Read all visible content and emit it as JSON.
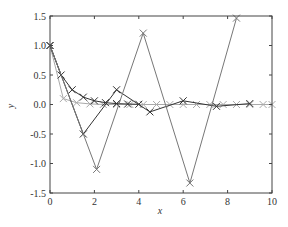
{
  "chart_data": {
    "type": "line",
    "title": "",
    "xlabel": "x",
    "ylabel": "y",
    "xlim": [
      0,
      10
    ],
    "ylim": [
      -1.5,
      1.5
    ],
    "xticks": [
      0,
      2,
      4,
      6,
      8,
      10
    ],
    "xtick_labels": [
      "0",
      "2",
      "4",
      "6",
      "8",
      "10"
    ],
    "yticks": [
      -1.5,
      -1.0,
      -0.5,
      0.0,
      0.5,
      1.0,
      1.5
    ],
    "ytick_labels": [
      "-1.5",
      "-1.0",
      "-0.5",
      "0.0",
      "0.5",
      "1.0",
      "1.5"
    ],
    "grid": false,
    "legend": null,
    "marker": "x",
    "series": [
      {
        "name": "light-decay",
        "color": "#aaaaaa",
        "x": [
          0,
          0.6,
          1.2,
          1.8,
          2.4,
          3.0,
          3.6,
          4.2,
          4.8,
          5.4,
          6.0,
          6.6,
          7.2,
          7.8,
          8.4,
          9.0,
          9.6,
          10.0
        ],
        "y": [
          1.0,
          0.1,
          0.03,
          0.01,
          0.0,
          0.0,
          0.0,
          0.0,
          0.0,
          0.0,
          0.0,
          0.0,
          0.0,
          0.0,
          0.0,
          0.0,
          0.0,
          0.0
        ]
      },
      {
        "name": "dark-decay",
        "color": "#333333",
        "x": [
          0,
          0.5,
          1.0,
          1.5,
          2.0,
          2.5,
          3.0,
          3.5,
          4.0
        ],
        "y": [
          1.0,
          0.5,
          0.25,
          0.125,
          0.0625,
          0.031,
          0.016,
          0.008,
          0.004
        ]
      },
      {
        "name": "dark-alternating",
        "color": "#333333",
        "x": [
          0,
          1.5,
          3.0,
          4.5,
          6.0,
          7.5,
          9.0
        ],
        "y": [
          1.0,
          -0.5,
          0.25,
          -0.125,
          0.0625,
          -0.031,
          0.016
        ]
      },
      {
        "name": "growing-oscillation",
        "color": "#777777",
        "x": [
          0,
          2.1,
          4.2,
          6.3,
          8.4
        ],
        "y": [
          1.0,
          -1.1,
          1.21,
          -1.331,
          1.464
        ]
      }
    ]
  }
}
